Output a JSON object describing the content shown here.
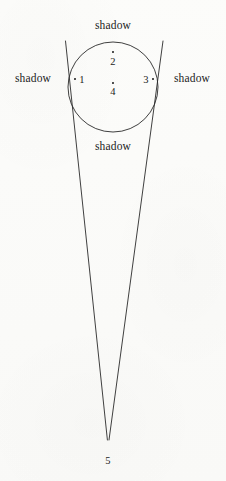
{
  "figure": {
    "background_color": "#fbfbf9",
    "ink_color": "#1c1c1c",
    "stroke_color": "#2a2a2a",
    "width": 226,
    "height": 481
  },
  "shapes": {
    "circle": {
      "name": "circle",
      "cx": 113,
      "cy": 87,
      "r": 45,
      "stroke_width": 0.9
    },
    "tangent_left": {
      "name": "left-tangent-line",
      "x1": 65.5,
      "y1": 41,
      "x2": 107.4,
      "y2": 440,
      "stroke_width": 0.9
    },
    "tangent_right": {
      "name": "right-tangent-line",
      "x1": 163.0,
      "y1": 41,
      "x2": 109.0,
      "y2": 440,
      "stroke_width": 0.9
    },
    "apex": {
      "name": "apex-vertex",
      "x": 108.2,
      "y": 440
    }
  },
  "labels": {
    "shadow_top": {
      "text": "shadow",
      "x": 113,
      "y": 26
    },
    "shadow_left": {
      "text": "shadow",
      "x": 33,
      "y": 79
    },
    "shadow_right": {
      "text": "shadow",
      "x": 192,
      "y": 79
    },
    "shadow_bottom": {
      "text": "shadow",
      "x": 113,
      "y": 147
    },
    "number_1": {
      "text": "1",
      "x": 82,
      "y": 80
    },
    "number_2": {
      "text": "2",
      "x": 113,
      "y": 62
    },
    "number_3": {
      "text": "3",
      "x": 146,
      "y": 80
    },
    "number_4": {
      "text": "4",
      "x": 113,
      "y": 92
    },
    "number_5": {
      "text": "5",
      "x": 108,
      "y": 461
    }
  },
  "point_dots": {
    "dot_1": {
      "x": 75,
      "y": 79
    },
    "dot_2": {
      "x": 113,
      "y": 52
    },
    "dot_3": {
      "x": 153,
      "y": 79
    },
    "dot_4": {
      "x": 113,
      "y": 83
    }
  }
}
